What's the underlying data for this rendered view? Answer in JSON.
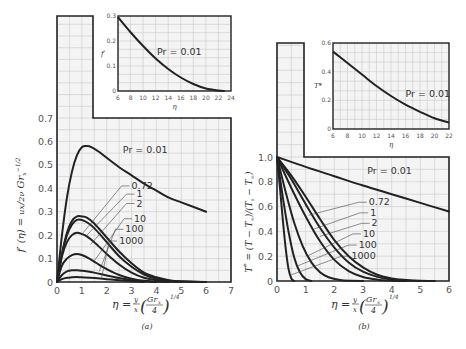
{
  "chart_data": [
    {
      "id": "a",
      "type": "line",
      "caption": "(a)",
      "title": "",
      "xlabel": "η = (y/x)(Grx/4)^1/4",
      "ylabel": "f′(η) = (ux/2ν) Grx^−1/2",
      "xlim": [
        0,
        7
      ],
      "ylim": [
        0,
        0.7
      ],
      "xticks": [
        "0",
        "1",
        "2",
        "3",
        "4",
        "5",
        "6",
        "7"
      ],
      "yticks": [
        "0",
        "0.1",
        "0.2",
        "0.3",
        "0.4",
        "0.5",
        "0.6",
        "0.7"
      ],
      "grid": true,
      "series": [
        {
          "name": "Pr = 0.01",
          "x": [
            0,
            0.2,
            0.4,
            0.6,
            0.8,
            1.0,
            1.2,
            1.4,
            1.7,
            2.0,
            2.5,
            3.0,
            3.5,
            4.0,
            4.5,
            5.0,
            5.5,
            6.0
          ],
          "y": [
            0,
            0.2,
            0.36,
            0.47,
            0.54,
            0.575,
            0.58,
            0.575,
            0.555,
            0.53,
            0.49,
            0.455,
            0.42,
            0.39,
            0.36,
            0.34,
            0.32,
            0.3
          ]
        },
        {
          "name": "0.72",
          "x": [
            0,
            0.2,
            0.4,
            0.6,
            0.8,
            1.0,
            1.2,
            1.5,
            2.0,
            2.5,
            3.0,
            3.5,
            4.0,
            4.5,
            5.0,
            6.0
          ],
          "y": [
            0,
            0.12,
            0.21,
            0.26,
            0.28,
            0.28,
            0.275,
            0.25,
            0.19,
            0.13,
            0.08,
            0.04,
            0.02,
            0.008,
            0.003,
            0
          ]
        },
        {
          "name": "1",
          "x": [
            0,
            0.2,
            0.4,
            0.6,
            0.8,
            1.0,
            1.2,
            1.5,
            2.0,
            2.5,
            3.0,
            3.5,
            4.0,
            4.5,
            5.0,
            6.0
          ],
          "y": [
            0,
            0.12,
            0.2,
            0.245,
            0.265,
            0.265,
            0.255,
            0.23,
            0.17,
            0.11,
            0.065,
            0.032,
            0.014,
            0.005,
            0.002,
            0
          ]
        },
        {
          "name": "2",
          "x": [
            0,
            0.2,
            0.4,
            0.6,
            0.8,
            1.0,
            1.2,
            1.5,
            2.0,
            2.5,
            3.0,
            3.5,
            4.0,
            4.5,
            5.0
          ],
          "y": [
            0,
            0.11,
            0.17,
            0.2,
            0.21,
            0.205,
            0.195,
            0.17,
            0.12,
            0.075,
            0.04,
            0.018,
            0.007,
            0.002,
            0
          ]
        },
        {
          "name": "10",
          "x": [
            0,
            0.2,
            0.4,
            0.6,
            0.8,
            1.0,
            1.3,
            1.6,
            2.0,
            2.5,
            3.0,
            3.5,
            4.0,
            4.5
          ],
          "y": [
            0,
            0.07,
            0.1,
            0.115,
            0.12,
            0.115,
            0.1,
            0.08,
            0.055,
            0.03,
            0.014,
            0.005,
            0.002,
            0
          ]
        },
        {
          "name": "100",
          "x": [
            0,
            0.2,
            0.4,
            0.6,
            0.8,
            1.0,
            1.5,
            2.0,
            2.5,
            3.0,
            3.5,
            4.0
          ],
          "y": [
            0,
            0.03,
            0.045,
            0.05,
            0.05,
            0.048,
            0.04,
            0.028,
            0.017,
            0.008,
            0.003,
            0
          ]
        },
        {
          "name": "1000",
          "x": [
            0,
            0.2,
            0.4,
            0.6,
            0.8,
            1.0,
            1.5,
            2.0,
            2.5,
            3.0,
            3.5
          ],
          "y": [
            0,
            0.012,
            0.018,
            0.02,
            0.021,
            0.02,
            0.017,
            0.012,
            0.007,
            0.003,
            0
          ]
        }
      ],
      "labels": [
        {
          "text": "Pr = 0.01",
          "x": 2.65,
          "y": 0.565
        },
        {
          "text": "0.72",
          "x": 3.0,
          "y": 0.41
        },
        {
          "text": "1",
          "x": 3.2,
          "y": 0.375
        },
        {
          "text": "2",
          "x": 3.2,
          "y": 0.335
        },
        {
          "text": "10",
          "x": 3.1,
          "y": 0.27
        },
        {
          "text": "100",
          "x": 2.75,
          "y": 0.225
        },
        {
          "text": "1000",
          "x": 2.5,
          "y": 0.175
        }
      ],
      "inset": {
        "xlim": [
          6,
          24
        ],
        "ylim": [
          0,
          0.3
        ],
        "xticks": [
          "6",
          "8",
          "10",
          "12",
          "14",
          "16",
          "18",
          "20",
          "22",
          "24"
        ],
        "yticks": [
          "0",
          "0.1",
          "0.2",
          "0.3"
        ],
        "xlabel": "η",
        "ylabel": "f′",
        "series": [
          {
            "name": "Pr = 0.01",
            "x": [
              6,
              8,
              10,
              12,
              14,
              16,
              18,
              20,
              22,
              23
            ],
            "y": [
              0.295,
              0.235,
              0.18,
              0.13,
              0.088,
              0.054,
              0.028,
              0.01,
              0.002,
              0
            ]
          }
        ],
        "label": {
          "text": "Pr = 0.01",
          "x": 12.2,
          "y": 0.155
        }
      }
    },
    {
      "id": "b",
      "type": "line",
      "caption": "(b)",
      "title": "",
      "xlabel": "η = (y/x)(Grx/4)^1/4",
      "ylabel": "T* = (T − T∞)/(Ts − T∞)",
      "xlim": [
        0,
        6
      ],
      "ylim": [
        0,
        1.0
      ],
      "xticks": [
        "0",
        "1",
        "2",
        "3",
        "4",
        "5",
        "6"
      ],
      "yticks": [
        "0",
        "0.2",
        "0.4",
        "0.6",
        "0.8",
        "1.0"
      ],
      "grid": true,
      "series": [
        {
          "name": "Pr = 0.01",
          "x": [
            0,
            1,
            2,
            3,
            4,
            5,
            6
          ],
          "y": [
            1.0,
            0.92,
            0.845,
            0.77,
            0.7,
            0.63,
            0.56
          ]
        },
        {
          "name": "0.72",
          "x": [
            0,
            0.5,
            1.0,
            1.5,
            2.0,
            2.5,
            3.0,
            3.5,
            4.0,
            4.5,
            5.0,
            5.5
          ],
          "y": [
            1.0,
            0.85,
            0.68,
            0.5,
            0.33,
            0.2,
            0.11,
            0.05,
            0.02,
            0.008,
            0.002,
            0
          ]
        },
        {
          "name": "1",
          "x": [
            0,
            0.5,
            1.0,
            1.5,
            2.0,
            2.5,
            3.0,
            3.5,
            4.0,
            4.5,
            5.0
          ],
          "y": [
            1.0,
            0.82,
            0.62,
            0.43,
            0.27,
            0.15,
            0.075,
            0.033,
            0.012,
            0.004,
            0
          ]
        },
        {
          "name": "2",
          "x": [
            0,
            0.5,
            1.0,
            1.5,
            2.0,
            2.5,
            3.0,
            3.5,
            4.0,
            4.5
          ],
          "y": [
            1.0,
            0.75,
            0.52,
            0.32,
            0.17,
            0.08,
            0.032,
            0.011,
            0.003,
            0
          ]
        },
        {
          "name": "10",
          "x": [
            0,
            0.3,
            0.6,
            0.9,
            1.2,
            1.5,
            1.8,
            2.2,
            2.6,
            3.0
          ],
          "y": [
            1.0,
            0.72,
            0.47,
            0.28,
            0.15,
            0.07,
            0.03,
            0.008,
            0.002,
            0
          ]
        },
        {
          "name": "100",
          "x": [
            0,
            0.2,
            0.4,
            0.6,
            0.8,
            1.0,
            1.2
          ],
          "y": [
            1.0,
            0.68,
            0.4,
            0.19,
            0.07,
            0.015,
            0
          ]
        },
        {
          "name": "1000",
          "x": [
            0,
            0.1,
            0.2,
            0.3,
            0.4,
            0.5,
            0.6
          ],
          "y": [
            1.0,
            0.76,
            0.5,
            0.27,
            0.1,
            0.02,
            0
          ]
        }
      ],
      "labels": [
        {
          "text": "Pr = 0.01",
          "x": 3.15,
          "y": 0.885
        },
        {
          "text": "0.72",
          "x": 3.2,
          "y": 0.635
        },
        {
          "text": "1",
          "x": 3.25,
          "y": 0.55
        },
        {
          "text": "2",
          "x": 3.3,
          "y": 0.465
        },
        {
          "text": "10",
          "x": 3.0,
          "y": 0.38
        },
        {
          "text": "100",
          "x": 2.85,
          "y": 0.29
        },
        {
          "text": "1000",
          "x": 2.6,
          "y": 0.2
        }
      ],
      "inset": {
        "xlim": [
          6,
          22
        ],
        "ylim": [
          0,
          0.6
        ],
        "xticks": [
          "6",
          "8",
          "10",
          "12",
          "14",
          "16",
          "18",
          "20",
          "22"
        ],
        "yticks": [
          "0",
          "0.2",
          "0.4",
          "0.6"
        ],
        "xlabel": "η",
        "ylabel": "T*",
        "series": [
          {
            "name": "Pr = 0.01",
            "x": [
              6,
              8,
              10,
              12,
              14,
              16,
              18,
              20,
              22
            ],
            "y": [
              0.54,
              0.46,
              0.38,
              0.3,
              0.23,
              0.17,
              0.12,
              0.075,
              0.045
            ]
          }
        ],
        "label": {
          "text": "Pr = 0.01",
          "x": 16.0,
          "y": 0.245
        }
      }
    }
  ]
}
